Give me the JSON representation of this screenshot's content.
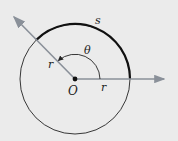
{
  "diagram": {
    "labels": {
      "arc": "s",
      "angle": "θ",
      "radius_ray": "r",
      "radius_axis": "r",
      "origin": "O"
    },
    "colors": {
      "background": "#ebebeb",
      "circle": "#222222",
      "arc": "#111111",
      "rays": "#8a9099"
    },
    "geometry": {
      "center": [
        75,
        79
      ],
      "radius": 55,
      "ray_angle_deg": 135
    }
  }
}
